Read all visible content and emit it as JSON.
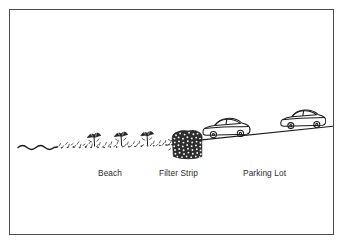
{
  "figure": {
    "kind": "line-drawing-diagram",
    "background_color": "#ffffff",
    "frame_color": "#4a4a52",
    "ink_color": "#1a1a1a"
  },
  "labels": [
    {
      "id": "beach",
      "text": "Beach",
      "x": 98,
      "y": 168
    },
    {
      "id": "filter",
      "text": "Filter Strip",
      "x": 159,
      "y": 168
    },
    {
      "id": "parking",
      "text": "Parking Lot",
      "x": 243,
      "y": 168
    }
  ],
  "scene": {
    "water": {
      "name": "wavy-water-line",
      "x_start": 18,
      "x_end": 57,
      "y": 147,
      "wave_count": 4,
      "amplitude": 2.4
    },
    "sand": {
      "name": "stippled-sand-texture",
      "x_start": 57,
      "x_end": 178,
      "y_start": 146,
      "y_end": 140,
      "tick_count": 96
    },
    "umbrellas": [
      {
        "name": "beach-umbrella-1",
        "x": 94,
        "y": 141,
        "scale": 1.0
      },
      {
        "name": "beach-umbrella-2",
        "x": 121,
        "y": 140,
        "scale": 1.0
      },
      {
        "name": "beach-umbrella-3",
        "x": 147,
        "y": 139,
        "scale": 0.95
      }
    ],
    "filter_strip": {
      "name": "filter-strip-vegetation",
      "x_left": 172,
      "x_right": 202,
      "y_top": 131,
      "y_bottom": 158,
      "blob_count": 150
    },
    "ground_line": {
      "name": "parking-lot-grade-line",
      "x_start": 197,
      "y_start": 140,
      "x_end": 333,
      "y_end": 126
    },
    "cars": [
      {
        "name": "parked-car-1",
        "x": 201,
        "y": 113,
        "length": 48,
        "wheels": 2
      },
      {
        "name": "parked-car-2",
        "x": 279,
        "y": 104,
        "length": 47,
        "wheels": 2
      }
    ]
  }
}
